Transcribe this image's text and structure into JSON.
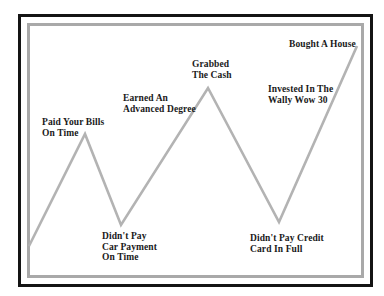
{
  "diagram": {
    "frame": {
      "outer_color": "#141414",
      "inner_color": "#a9a9a9"
    },
    "line": {
      "color": "#b3b3b3",
      "points": [
        [
          29,
          246
        ],
        [
          85,
          134
        ],
        [
          121,
          225
        ],
        [
          208,
          88
        ],
        [
          279,
          222
        ],
        [
          357,
          46
        ]
      ]
    },
    "labels": [
      {
        "id": "paid-bills",
        "lines": [
          "Paid Your Bills",
          "On Time"
        ],
        "x": 42,
        "y": 117
      },
      {
        "id": "earned-degree",
        "lines": [
          "Earned An",
          "Advanced Degree"
        ],
        "x": 123,
        "y": 93
      },
      {
        "id": "grabbed-cash",
        "lines": [
          "Grabbed",
          "The Cash"
        ],
        "x": 192,
        "y": 59
      },
      {
        "id": "bought-house",
        "lines": [
          "Bought A House"
        ],
        "x": 289,
        "y": 39
      },
      {
        "id": "invested-wally",
        "lines": [
          "Invested In The",
          "Wally Wow 30"
        ],
        "x": 268,
        "y": 84
      },
      {
        "id": "no-car-payment",
        "lines": [
          "Didn't Pay",
          "Car Payment",
          "On Time"
        ],
        "x": 102,
        "y": 231
      },
      {
        "id": "no-credit-card",
        "lines": [
          "Didn't Pay Credit",
          "Card In Full"
        ],
        "x": 250,
        "y": 233
      }
    ]
  }
}
